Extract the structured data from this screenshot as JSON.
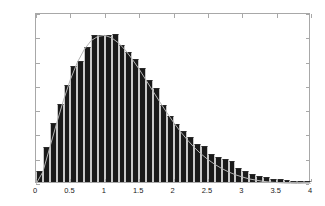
{
  "chart_data": {
    "type": "bar",
    "title": "",
    "subtitle": "",
    "xlabel": "",
    "ylabel": "",
    "xlim": [
      0,
      4
    ],
    "ylim": [
      0,
      0.7
    ],
    "grid": false,
    "legend": null,
    "legend_position": "none",
    "bar_color": "#1a1a1a",
    "bar_edge_color": "#c9c9c9",
    "curve_color": "#b4b4b4",
    "axis_color": "#a8a8a8",
    "background_color": "#ffffff",
    "bin_width": 0.1,
    "n_bins": 40,
    "xticks": [
      0,
      0.5,
      1,
      1.5,
      2,
      2.5,
      3,
      3.5,
      4
    ],
    "xtick_labels": [
      "0",
      "0.5",
      "1",
      "1.5",
      "2",
      "2.5",
      "3",
      "3.5",
      "4"
    ],
    "yticks": [
      0,
      0.1,
      0.2,
      0.3,
      0.4,
      0.5,
      0.6,
      0.7
    ],
    "ytick_labels": [
      "0",
      "0.1",
      "0.2",
      "0.3",
      "0.4",
      "0.5",
      "0.6",
      "0.7"
    ],
    "categories": [
      "0.05",
      "0.15",
      "0.25",
      "0.35",
      "0.45",
      "0.55",
      "0.65",
      "0.75",
      "0.85",
      "0.95",
      "1.05",
      "1.15",
      "1.25",
      "1.35",
      "1.45",
      "1.55",
      "1.65",
      "1.75",
      "1.85",
      "1.95",
      "2.05",
      "2.15",
      "2.25",
      "2.35",
      "2.45",
      "2.55",
      "2.65",
      "2.75",
      "2.85",
      "2.95",
      "3.05",
      "3.15",
      "3.25",
      "3.35",
      "3.45",
      "3.55",
      "3.65",
      "3.75",
      "3.85",
      "3.95"
    ],
    "values": [
      0.045,
      0.143,
      0.245,
      0.321,
      0.401,
      0.477,
      0.497,
      0.556,
      0.605,
      0.604,
      0.605,
      0.611,
      0.565,
      0.536,
      0.505,
      0.47,
      0.421,
      0.386,
      0.319,
      0.271,
      0.24,
      0.212,
      0.186,
      0.155,
      0.148,
      0.117,
      0.104,
      0.093,
      0.085,
      0.059,
      0.045,
      0.035,
      0.026,
      0.02,
      0.013,
      0.011,
      0.008,
      0.004,
      0.002,
      0.001
    ],
    "series": [
      {
        "name": "histogram",
        "type": "bar",
        "values": [
          0.045,
          0.143,
          0.245,
          0.321,
          0.401,
          0.477,
          0.497,
          0.556,
          0.605,
          0.604,
          0.605,
          0.611,
          0.565,
          0.536,
          0.505,
          0.47,
          0.421,
          0.386,
          0.319,
          0.271,
          0.24,
          0.212,
          0.186,
          0.155,
          0.148,
          0.117,
          0.104,
          0.093,
          0.085,
          0.059,
          0.045,
          0.035,
          0.026,
          0.02,
          0.013,
          0.011,
          0.008,
          0.004,
          0.002,
          0.001
        ]
      },
      {
        "name": "theoretical-pdf",
        "type": "line",
        "x": [
          0.0,
          0.1,
          0.2,
          0.3,
          0.4,
          0.5,
          0.6,
          0.7,
          0.8,
          0.9,
          1.0,
          1.1,
          1.2,
          1.3,
          1.4,
          1.5,
          1.6,
          1.7,
          1.8,
          1.9,
          2.0,
          2.1,
          2.2,
          2.3,
          2.4,
          2.5,
          2.6,
          2.7,
          2.8,
          2.9,
          3.0,
          3.1,
          3.2,
          3.3,
          3.4,
          3.5,
          3.6,
          3.7,
          3.8,
          3.9,
          4.0
        ],
        "y": [
          0.0,
          0.05,
          0.15,
          0.25,
          0.345,
          0.43,
          0.5,
          0.553,
          0.59,
          0.608,
          0.612,
          0.602,
          0.581,
          0.551,
          0.514,
          0.473,
          0.428,
          0.383,
          0.338,
          0.295,
          0.254,
          0.216,
          0.182,
          0.151,
          0.124,
          0.101,
          0.081,
          0.064,
          0.05,
          0.038,
          0.029,
          0.021,
          0.016,
          0.011,
          0.008,
          0.006,
          0.004,
          0.003,
          0.002,
          0.001,
          0.001
        ]
      }
    ]
  }
}
